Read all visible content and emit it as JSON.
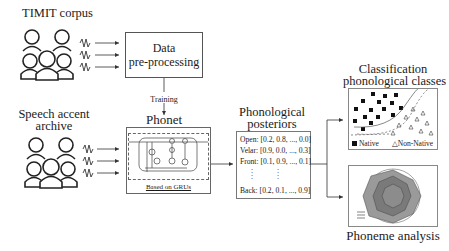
{
  "sources": {
    "timit": {
      "label": "TIMIT corpus",
      "icon": "people-group-icon"
    },
    "speech_accent": {
      "label_line1": "Speech accent",
      "label_line2": "archive",
      "icon": "people-group-icon"
    }
  },
  "preprocessing": {
    "line1": "Data",
    "line2": "pre-processing"
  },
  "training_label": "Training",
  "phonet": {
    "title": "Phonet",
    "caption": "Based on GRUs",
    "icon": "gru-cell-icon"
  },
  "posteriors": {
    "title_line1": "Phonological",
    "title_line2": "posteriors",
    "rows": [
      "Open: [0.2, 0.8, ..., 0.0]",
      "Velar: [0.9, 0.0, ..., 0.3]",
      "Front: [0.1, 0.9, ..., 0.1]",
      "Back: [0.2, 0.1, ..., 0.9]"
    ],
    "ellipsis": ":"
  },
  "classification": {
    "title_line1": "Classification",
    "title_line2": "phonological classes",
    "legend": {
      "native": "Native",
      "non_native": "Non-Native"
    }
  },
  "phoneme_analysis": {
    "title": "Phoneme analysis",
    "icon": "radar-chart-icon"
  },
  "colors": {
    "line": "#333333",
    "box_border": "#555555",
    "radar_fill": "#9a9a9a",
    "radar_inner": "#7a7a7a"
  }
}
